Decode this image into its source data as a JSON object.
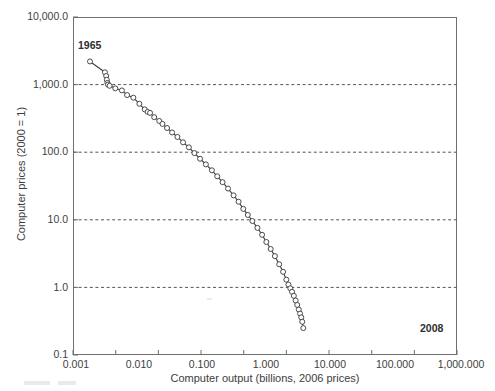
{
  "chart_data": {
    "type": "line",
    "title": "",
    "subtitle": "",
    "xlabel": "Computer output (billions, 2006 prices)",
    "ylabel": "Computer prices (2000 = 1)",
    "xscale": "log",
    "yscale": "log",
    "xlim": [
      0.001,
      1000000
    ],
    "ylim": [
      0.1,
      10000
    ],
    "grid": "horizontal-dashed",
    "legend": "none",
    "xticklabels": [
      "0.001",
      "0.010",
      "0.100",
      "1.000",
      "10.000",
      "100.000",
      "1,000.000"
    ],
    "xtickvalues": [
      0.001,
      0.01,
      0.1,
      1,
      10,
      100,
      1000000
    ],
    "yticklabels": [
      "10,000.0",
      "1,000.0",
      "100.0",
      "10.0",
      "1.0",
      "0.1"
    ],
    "ytickvalues": [
      10000,
      1000,
      100,
      10,
      1,
      0.1
    ],
    "gridlines_y": [
      1000,
      100,
      10,
      1
    ],
    "marker": "open-circle",
    "line_color": "#3a3a3a",
    "marker_color": "#4a4a4a",
    "grid_color": "#555555",
    "axis_color": "#6f6f6f",
    "annotations": [
      {
        "text": "1965",
        "x": 0.0025,
        "y": 2200,
        "position": "above-left"
      },
      {
        "text": "2008",
        "x": 250.0,
        "y": 0.25,
        "position": "below-right"
      }
    ],
    "series": [
      {
        "name": "Computer prices vs output",
        "points": [
          [
            0.0025,
            2200.0
          ],
          [
            0.0056,
            1520.0
          ],
          [
            0.006,
            1340.0
          ],
          [
            0.0062,
            1180.0
          ],
          [
            0.0064,
            1060.0
          ],
          [
            0.0066,
            1000.0
          ],
          [
            0.0072,
            960.0
          ],
          [
            0.0098,
            880.0
          ],
          [
            0.014,
            820.0
          ],
          [
            0.0185,
            700.0
          ],
          [
            0.026,
            640.0
          ],
          [
            0.036,
            520.0
          ],
          [
            0.048,
            430.0
          ],
          [
            0.056,
            395.0
          ],
          [
            0.064,
            382.0
          ],
          [
            0.08,
            330.0
          ],
          [
            0.105,
            290.0
          ],
          [
            0.125,
            262.0
          ],
          [
            0.16,
            228.0
          ],
          [
            0.21,
            196.0
          ],
          [
            0.28,
            168.0
          ],
          [
            0.38,
            140.0
          ],
          [
            0.52,
            118.0
          ],
          [
            0.7,
            97.0
          ],
          [
            0.95,
            80.0
          ],
          [
            1.3,
            66.0
          ],
          [
            1.8,
            54.0
          ],
          [
            2.4,
            44.0
          ],
          [
            3.2,
            36.0
          ],
          [
            4.3,
            29.0
          ],
          [
            5.8,
            23.0
          ],
          [
            7.6,
            18.5
          ],
          [
            9.8,
            14.5
          ],
          [
            12.5,
            11.8
          ],
          [
            16.0,
            9.6
          ],
          [
            21.0,
            7.6
          ],
          [
            27.0,
            6.0
          ],
          [
            34.0,
            4.7
          ],
          [
            43.0,
            3.7
          ],
          [
            54.0,
            2.9
          ],
          [
            68.0,
            2.2
          ],
          [
            84.0,
            1.7
          ],
          [
            100.0,
            1.3
          ],
          [
            112.0,
            1.1
          ],
          [
            124.0,
            0.97
          ],
          [
            136.0,
            0.86
          ],
          [
            150.0,
            0.75
          ],
          [
            165.0,
            0.64
          ],
          [
            180.0,
            0.55
          ],
          [
            196.0,
            0.47
          ],
          [
            210.0,
            0.41
          ],
          [
            224.0,
            0.36
          ],
          [
            236.0,
            0.31
          ],
          [
            250.0,
            0.25
          ]
        ]
      }
    ]
  }
}
